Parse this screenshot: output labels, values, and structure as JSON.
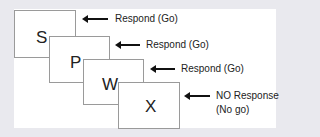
{
  "diagram": {
    "type": "go-no-go task stimulus sequence",
    "boxes": [
      {
        "letter": "S",
        "response": "Respond (Go)"
      },
      {
        "letter": "P",
        "response": "Respond (Go)"
      },
      {
        "letter": "W",
        "response": "Respond (Go)"
      },
      {
        "letter": "X",
        "response_line1": "NO Response",
        "response_line2": "(No go)"
      }
    ]
  },
  "colors": {
    "background": "#e9e9ee",
    "panel": "#ffffff",
    "box_border": "#9a9a9a",
    "arrow": "#111111"
  }
}
